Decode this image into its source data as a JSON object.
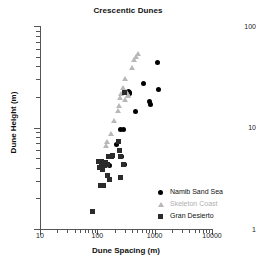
{
  "chart_data": {
    "type": "scatter",
    "title": "Crescentic Dunes",
    "xlabel": "Dune Spacing (m)",
    "ylabel": "Dune Height (m)",
    "xscale": "log",
    "yscale": "log",
    "xlim": [
      10,
      10000
    ],
    "ylim": [
      1,
      100
    ],
    "xticks": [
      10,
      100,
      1000,
      10000
    ],
    "xtick_labels": [
      "10",
      "100",
      "1000",
      "10000"
    ],
    "yticks": [
      1,
      10,
      100
    ],
    "ytick_labels": [
      "1",
      "10",
      "100"
    ],
    "grid": false,
    "legend_position": "lower right",
    "series": [
      {
        "name": "Namib Sand Sea",
        "marker": "circle",
        "color": "#000000",
        "points": [
          [
            155,
            5.2
          ],
          [
            170,
            5.2
          ],
          [
            160,
            4.2
          ],
          [
            215,
            6.8
          ],
          [
            250,
            5.2
          ],
          [
            265,
            5.2
          ],
          [
            255,
            9.6
          ],
          [
            285,
            9.6
          ],
          [
            300,
            4.3
          ],
          [
            345,
            22.5
          ],
          [
            360,
            22.0
          ],
          [
            370,
            21.5
          ],
          [
            470,
            14.5
          ],
          [
            640,
            27.0
          ],
          [
            820,
            18.0
          ],
          [
            830,
            16.8
          ],
          [
            1100,
            44.0
          ],
          [
            1180,
            23.5
          ]
        ]
      },
      {
        "name": "Skeleton Coast",
        "marker": "triangle",
        "color": "#b8b8b8",
        "points": [
          [
            120,
            4.3
          ],
          [
            130,
            4.4
          ],
          [
            140,
            6.5
          ],
          [
            150,
            7.2
          ],
          [
            175,
            8.6
          ],
          [
            195,
            11.5
          ],
          [
            225,
            14.5
          ],
          [
            235,
            16.2
          ],
          [
            245,
            19.5
          ],
          [
            260,
            21.5
          ],
          [
            275,
            24.5
          ],
          [
            300,
            30.0
          ],
          [
            330,
            22.0
          ],
          [
            345,
            21.0
          ],
          [
            400,
            39.0
          ],
          [
            430,
            46.0
          ],
          [
            470,
            50.0
          ],
          [
            520,
            53.0
          ],
          [
            345,
            20.5
          ],
          [
            300,
            18.5
          ]
        ]
      },
      {
        "name": "Gran Desierto",
        "marker": "square",
        "color": "#2b2b2b",
        "points": [
          [
            82,
            1.5
          ],
          [
            105,
            4.6
          ],
          [
            110,
            4.0
          ],
          [
            112,
            2.7
          ],
          [
            120,
            4.6
          ],
          [
            122,
            3.9
          ],
          [
            130,
            2.7
          ],
          [
            132,
            4.2
          ],
          [
            148,
            4.3
          ],
          [
            152,
            3.4
          ],
          [
            158,
            5.2
          ],
          [
            165,
            3.1
          ],
          [
            175,
            5.2
          ],
          [
            185,
            5.3
          ],
          [
            235,
            7.3
          ],
          [
            240,
            6.0
          ],
          [
            250,
            5.2
          ],
          [
            255,
            3.2
          ],
          [
            290,
            4.3
          ],
          [
            300,
            22.0
          ],
          [
            140,
            4.5
          ],
          [
            118,
            4.5
          ]
        ]
      }
    ]
  },
  "legend": {
    "items": [
      {
        "label": "Namib Sand Sea",
        "marker": "circle"
      },
      {
        "label": "Skeleton Coast",
        "marker": "triangle"
      },
      {
        "label": "Gran Desierto",
        "marker": "square"
      }
    ]
  }
}
